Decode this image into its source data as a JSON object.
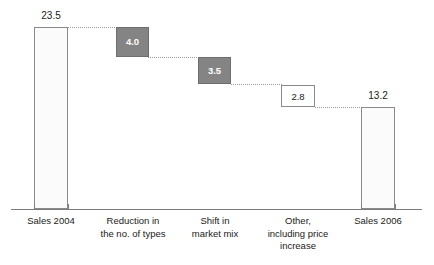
{
  "chart_data": {
    "type": "bar",
    "subtype": "waterfall",
    "title": "",
    "subtitle": "",
    "xlabel": "",
    "ylabel": "",
    "ylim": [
      0,
      25.6
    ],
    "grid": false,
    "legend": null,
    "categories": [
      "Sales 2004",
      "Reduction in\nthe no. of types",
      "Shift in\nmarket mix",
      "Other,\nincluding price\nincrease",
      "Sales 2006"
    ],
    "values": [
      23.5,
      -4.0,
      -3.5,
      -2.8,
      13.2
    ],
    "value_labels": [
      "23.5",
      "4.0",
      "3.5",
      "2.8",
      "13.2"
    ],
    "bar_kinds": [
      "total",
      "decrease-filled",
      "decrease-filled",
      "decrease-open",
      "total"
    ],
    "label_placements": [
      "above",
      "inside",
      "inside",
      "inside",
      "above"
    ],
    "cumulative_tops": [
      23.5,
      23.5,
      19.5,
      16.0,
      13.2
    ],
    "cumulative_bottoms": [
      0.0,
      19.5,
      16.0,
      13.2,
      0.0
    ],
    "colors": {
      "decrease_fill": "#848484",
      "total_fill": "#fbfbfb",
      "open_fill": "#ffffff",
      "bar_stroke": "#8a8a8a",
      "connector": "#9a9a9a",
      "axis": "#7b7b7b",
      "text": "#1a1a1a",
      "inbox_text": "#ffffff"
    }
  },
  "bars": [
    {
      "label": "Sales 2004",
      "value_label": "23.5",
      "x": 34,
      "width": 34,
      "top": 27,
      "bottom": 209,
      "kind": "total",
      "label_placement": "above",
      "label_x": 28,
      "label_y": 11,
      "label_width": 46,
      "cat_x": 8,
      "cat_width": 86
    },
    {
      "label": "Reduction in\nthe no. of types",
      "value_label": "4.0",
      "x": 116,
      "width": 33,
      "top": 27,
      "bottom": 57,
      "kind": "decrease-filled",
      "label_placement": "inside",
      "label_x": 116,
      "label_y": 37,
      "label_width": 33,
      "cat_x": 90,
      "cat_width": 86
    },
    {
      "label": "Shift in\nmarket mix",
      "value_label": "3.5",
      "x": 198,
      "width": 33,
      "top": 57,
      "bottom": 84,
      "kind": "decrease-filled",
      "label_placement": "inside",
      "label_x": 198,
      "label_y": 66,
      "label_width": 33,
      "cat_x": 172,
      "cat_width": 86
    },
    {
      "label": "Other,\nincluding price\nincrease",
      "value_label": "2.8",
      "x": 281,
      "width": 34,
      "top": 85,
      "bottom": 107,
      "kind": "decrease-open",
      "label_placement": "inside",
      "label_x": 281,
      "label_y": 92,
      "label_width": 34,
      "cat_x": 255,
      "cat_width": 86
    },
    {
      "label": "Sales 2006",
      "value_label": "13.2",
      "x": 361,
      "width": 34,
      "top": 107,
      "bottom": 209,
      "kind": "total",
      "label_placement": "above",
      "label_x": 355,
      "label_y": 91,
      "label_width": 46,
      "cat_x": 335,
      "cat_width": 86
    }
  ],
  "connectors": [
    {
      "x": 68,
      "y": 27,
      "width": 49
    },
    {
      "x": 148,
      "y": 57,
      "width": 51
    },
    {
      "x": 231,
      "y": 84,
      "width": 51
    },
    {
      "x": 315,
      "y": 107,
      "width": 47
    }
  ],
  "ticks": [
    {
      "x": 34,
      "y": 209,
      "height": 5
    },
    {
      "x": 68,
      "y": 209,
      "height": 5
    },
    {
      "x": 361,
      "y": 209,
      "height": 5
    },
    {
      "x": 395,
      "y": 209,
      "height": 5
    }
  ],
  "axis": {
    "x": 11,
    "y": 209,
    "width": 411
  }
}
